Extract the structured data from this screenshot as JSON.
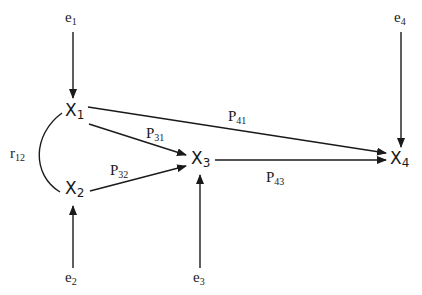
{
  "diagram": {
    "type": "path diagram",
    "nodes": [
      {
        "id": "X1",
        "base": "X",
        "sub": "1"
      },
      {
        "id": "X2",
        "base": "X",
        "sub": "2"
      },
      {
        "id": "X3",
        "base": "X",
        "sub": "3"
      },
      {
        "id": "X4",
        "base": "X",
        "sub": "4"
      }
    ],
    "errors": [
      {
        "id": "e1",
        "base": "e",
        "sub": "1",
        "target": "X1"
      },
      {
        "id": "e2",
        "base": "e",
        "sub": "2",
        "target": "X2"
      },
      {
        "id": "e3",
        "base": "e",
        "sub": "3",
        "target": "X3"
      },
      {
        "id": "e4",
        "base": "e",
        "sub": "4",
        "target": "X4"
      }
    ],
    "paths": [
      {
        "id": "P31",
        "base": "P",
        "sub": "31",
        "from": "X1",
        "to": "X3"
      },
      {
        "id": "P32",
        "base": "P",
        "sub": "32",
        "from": "X2",
        "to": "X3"
      },
      {
        "id": "P41",
        "base": "P",
        "sub": "41",
        "from": "X1",
        "to": "X4"
      },
      {
        "id": "P43",
        "base": "P",
        "sub": "43",
        "from": "X3",
        "to": "X4"
      }
    ],
    "correlations": [
      {
        "id": "r12",
        "base": "r",
        "sub": "12",
        "between": [
          "X1",
          "X2"
        ]
      }
    ]
  }
}
